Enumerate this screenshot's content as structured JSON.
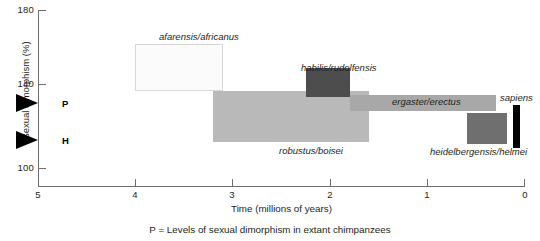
{
  "chart_data": {
    "type": "bar",
    "title": "",
    "xlabel": "Time (millions of years)",
    "ylabel": "Sexual dimorphism (%)",
    "xlim": [
      5,
      0
    ],
    "ylim": [
      100,
      180
    ],
    "x_ticks": [
      "5",
      "4",
      "3",
      "2",
      "1",
      "0"
    ],
    "x_tick_values": [
      5,
      4,
      3,
      2,
      1,
      0
    ],
    "y_ticks": [
      "180",
      "140",
      "100"
    ],
    "y_tick_values": [
      180,
      140,
      100
    ],
    "grid": false,
    "legend": "none",
    "footnote": "P = Levels of sexual dimorphism in extant chimpanzees",
    "taxa": [
      {
        "name": "afarensis/africanus",
        "label": "afarensis/africanus",
        "x_start": 4.0,
        "x_end": 3.1,
        "y_low": 139.0,
        "y_high": 163.0,
        "fill": "#fbfbfb",
        "stroke": "#d7d7d7",
        "label_pos": "above"
      },
      {
        "name": "robustus/boisei",
        "label": "robustus/boisei",
        "x_start": 3.2,
        "x_end": 1.6,
        "y_low": 113.0,
        "y_high": 139.0,
        "fill": "#b9b9b9",
        "stroke": "none",
        "label_pos": "below"
      },
      {
        "name": "habilis/rudolfensis",
        "label": "habilis/rudolfensis",
        "x_start": 2.25,
        "x_end": 1.8,
        "y_low": 136.0,
        "y_high": 150.5,
        "fill": "#4d4d4d",
        "stroke": "none",
        "label_pos": "above"
      },
      {
        "name": "ergaster/erectus",
        "label": "ergaster/erectus",
        "x_start": 1.8,
        "x_end": 0.3,
        "y_low": 129.0,
        "y_high": 137.0,
        "fill": "#a8a8a8",
        "stroke": "none",
        "label_pos": "above"
      },
      {
        "name": "heidelbergensis/helmei",
        "label": "heidelbergensis/helmei",
        "x_start": 0.6,
        "x_end": 0.18,
        "y_low": 112.0,
        "y_high": 128.0,
        "fill": "#6f6f6f",
        "stroke": "none",
        "label_pos": "below"
      },
      {
        "name": "sapiens",
        "label": "sapiens",
        "x_start": 0.12,
        "x_end": 0.05,
        "y_low": 110.0,
        "y_high": 132.0,
        "fill": "#000000",
        "stroke": "none",
        "label_pos": "above"
      }
    ],
    "markers": [
      {
        "name": "P",
        "label": "P",
        "value": 130.0,
        "description": "Levels of sexual dimorphism in extant chimpanzees"
      },
      {
        "name": "H",
        "label": "H",
        "value": 112.0,
        "description": "Levels of sexual dimorphism in extant humans"
      }
    ],
    "colors": {
      "axis": "#6d6e70",
      "text": "#231f20",
      "marker": "#000000"
    }
  }
}
